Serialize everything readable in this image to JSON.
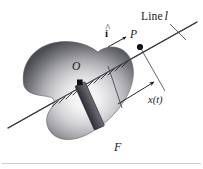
{
  "figure": {
    "background_color": "#ffffff",
    "width": 203,
    "height": 169
  },
  "labels": {
    "line_label": "Line",
    "line_symbol": "l",
    "unit_vector": "i",
    "unit_vector_accent": "^",
    "point_p": "P",
    "point_o": "O",
    "coordinate": "x(t)",
    "frame": "F"
  },
  "colors": {
    "ink": "#1a1a1a",
    "line_stroke": "#4a4a52",
    "body_dark": "#4e4e54",
    "body_mid": "#9a9aa0",
    "body_light": "#f2f2f2",
    "bar_dark": "#3f3f45",
    "bar_light": "#6e6e76",
    "marker_fill": "#111111",
    "rule": "#c8c8c8",
    "hatch": "#2e2e34"
  },
  "geometry": {
    "line_start": [
      8,
      128
    ],
    "line_end": [
      197,
      22
    ],
    "point_p": [
      140,
      47
    ],
    "point_o": [
      80,
      82
    ],
    "bar_angle_deg": 62,
    "dimension_arrow_from": [
      120,
      103
    ],
    "dimension_arrow_to": [
      152,
      84
    ]
  },
  "elements": {
    "body_name": "rigid-body-blob",
    "bar_name": "slider-bar",
    "hatch_name": "hatch-marks",
    "bottom_rule_name": "bottom-rule"
  }
}
